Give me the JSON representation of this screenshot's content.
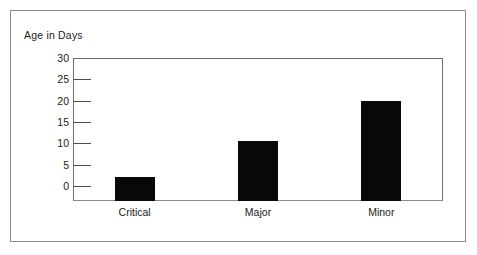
{
  "chart_data": {
    "type": "bar",
    "title": "Age in Days",
    "xlabel": "",
    "ylabel": "Age in Days",
    "categories": [
      "Critical",
      "Major",
      "Minor"
    ],
    "values": [
      2,
      10.5,
      20
    ],
    "series": [
      {
        "name": "Age in Days",
        "values": [
          2,
          10.5,
          20
        ]
      }
    ],
    "ylim": [
      0,
      30
    ],
    "yticks": [
      0,
      5,
      10,
      15,
      20,
      25,
      30
    ],
    "ytick_labels": [
      "0",
      "5",
      "10",
      "15",
      "20",
      "25",
      "30"
    ],
    "grid": false,
    "legend": false,
    "bar_color": "#080808",
    "frame_color": "#6e6e6e",
    "background": "#ffffff"
  }
}
